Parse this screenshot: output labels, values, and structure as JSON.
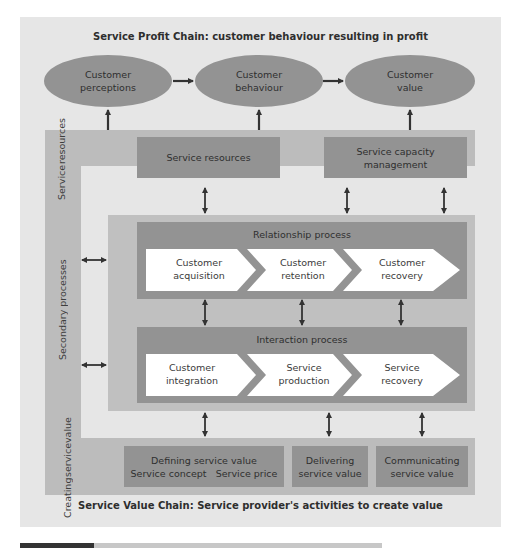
{
  "diagram": {
    "top_title": "Service Profit Chain: customer behaviour resulting in profit",
    "bottom_title": "Service Value Chain: Service provider's activities to create value",
    "ovals": [
      {
        "line1": "Customer",
        "line2": "perceptions"
      },
      {
        "line1": "Customer",
        "line2": "behaviour"
      },
      {
        "line1": "Customer",
        "line2": "value"
      }
    ],
    "side_labels": {
      "service_resources": [
        "Service",
        "resources"
      ],
      "secondary_processes": "Secondary processes",
      "primary_processes": "Primary processes",
      "creating_service_value": [
        "Creating",
        "service",
        "value"
      ]
    },
    "resource_boxes": [
      {
        "line1": "Service resources",
        "line2": ""
      },
      {
        "line1": "Service capacity",
        "line2": "management"
      }
    ],
    "relationship_process": {
      "title": "Relationship process",
      "steps": [
        {
          "line1": "Customer",
          "line2": "acquisition"
        },
        {
          "line1": "Customer",
          "line2": "retention"
        },
        {
          "line1": "Customer",
          "line2": "recovery"
        }
      ]
    },
    "interaction_process": {
      "title": "Interaction process",
      "steps": [
        {
          "line1": "Customer",
          "line2": "integration"
        },
        {
          "line1": "Service",
          "line2": "production"
        },
        {
          "line1": "Service",
          "line2": "recovery"
        }
      ]
    },
    "value_boxes": [
      {
        "line1": "Defining service value",
        "line2a": "Service concept",
        "line2b": "Service price"
      },
      {
        "line1": "Delivering",
        "line2": "service value"
      },
      {
        "line1": "Communicating",
        "line2": "service value"
      }
    ]
  },
  "colors": {
    "panel": "#e6e6e6",
    "band": "#bcbcbc",
    "dark": "#939393",
    "chevron": "#ffffff",
    "arrow": "#333333"
  }
}
